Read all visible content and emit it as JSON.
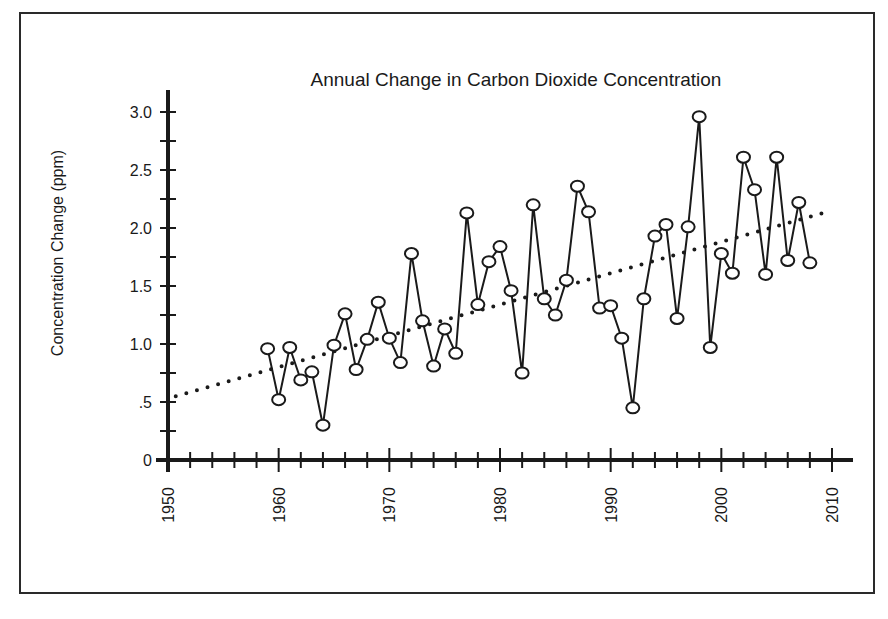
{
  "chart_data": {
    "type": "line",
    "title": "Annual Change in Carbon Dioxide Concentration",
    "xlabel": "",
    "ylabel": "Concentration Change (ppm)",
    "xlim": [
      1950,
      2010
    ],
    "ylim": [
      0,
      3.0
    ],
    "x_ticks": [
      1950,
      1960,
      1970,
      1980,
      1990,
      2000,
      2010
    ],
    "x_tick_labels": [
      "1950",
      "1960",
      "1970",
      "1980",
      "1990",
      "2000",
      "2010"
    ],
    "x_minor_tick_step": 2,
    "y_ticks": [
      0,
      0.5,
      1.0,
      1.5,
      2.0,
      2.5,
      3.0
    ],
    "y_tick_labels": [
      "0",
      ".5",
      "1.0",
      "1.5",
      "2.0",
      "2.5",
      "3.0"
    ],
    "y_minor_tick_step": 0.25,
    "grid": false,
    "legend": null,
    "x": [
      1959,
      1960,
      1961,
      1962,
      1963,
      1964,
      1965,
      1966,
      1967,
      1968,
      1969,
      1970,
      1971,
      1972,
      1973,
      1974,
      1975,
      1976,
      1977,
      1978,
      1979,
      1980,
      1981,
      1982,
      1983,
      1984,
      1985,
      1986,
      1987,
      1988,
      1989,
      1990,
      1991,
      1992,
      1993,
      1994,
      1995,
      1996,
      1997,
      1998,
      1999,
      2000,
      2001,
      2002,
      2003,
      2004,
      2005,
      2006,
      2007,
      2008
    ],
    "series": [
      {
        "name": "Annual change",
        "style": "line with open circle markers",
        "color": "#1a1a1a",
        "values": [
          0.96,
          0.52,
          0.97,
          0.69,
          0.76,
          0.3,
          0.99,
          1.26,
          0.78,
          1.04,
          1.36,
          1.05,
          0.84,
          1.78,
          1.2,
          0.81,
          1.13,
          0.92,
          2.13,
          1.34,
          1.71,
          1.84,
          1.46,
          0.75,
          2.2,
          1.39,
          1.25,
          1.55,
          2.36,
          2.14,
          1.31,
          1.33,
          1.05,
          0.45,
          1.39,
          1.93,
          2.03,
          1.22,
          2.01,
          2.96,
          0.97,
          1.78,
          1.61,
          2.61,
          2.33,
          1.6,
          2.61,
          1.72,
          2.22,
          1.7
        ]
      },
      {
        "name": "Trend",
        "style": "dotted linear trendline",
        "color": "#1a1a1a",
        "x": [
          1950.7,
          2010
        ],
        "values": [
          0.55,
          2.15
        ]
      }
    ]
  }
}
